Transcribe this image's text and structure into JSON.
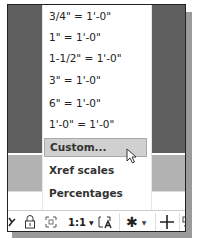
{
  "menu": {
    "items": [
      {
        "label": "3/4\" = 1'-0\"",
        "highlighted": false
      },
      {
        "label": "1\" = 1'-0\"",
        "highlighted": false
      },
      {
        "label": "1-1/2\" = 1'-0\"",
        "highlighted": false
      },
      {
        "label": "3\" = 1'-0\"",
        "highlighted": false
      },
      {
        "label": "6\" = 1'-0\"",
        "highlighted": false
      },
      {
        "label": "1'-0\" = 1'-0\"",
        "highlighted": false
      },
      {
        "label": "Custom...",
        "highlighted": true
      },
      {
        "label": "Xref scales",
        "highlighted": false
      },
      {
        "label": "Percentages",
        "highlighted": false
      }
    ]
  },
  "toolbar": {
    "scale_label": "1:1",
    "icons": [
      "partial-left-icon",
      "lock-icon",
      "maximize-viewport-icon",
      "scale-dropdown",
      "annotation-scale-icon",
      "gear-icon",
      "plus-icon",
      "partial-right-icon"
    ]
  },
  "colors": {
    "highlight": "#d0d0d0",
    "dark_bg": "#5f5f5f",
    "mid_bg": "#b2b2b2"
  }
}
